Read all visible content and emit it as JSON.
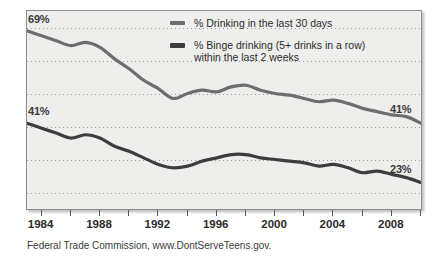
{
  "chart_data": {
    "type": "line",
    "title": "",
    "subtitle": "",
    "xlabel": "",
    "ylabel": "",
    "xlim": [
      1983,
      2010
    ],
    "ylim": [
      15,
      75
    ],
    "grid": true,
    "gridlines_y": [
      70,
      60,
      50,
      40,
      30,
      20
    ],
    "legend_position": "top-right",
    "x": [
      1983,
      1984,
      1985,
      1986,
      1987,
      1988,
      1989,
      1990,
      1991,
      1992,
      1993,
      1994,
      1995,
      1996,
      1997,
      1998,
      1999,
      2000,
      2001,
      2002,
      2003,
      2004,
      2005,
      2006,
      2007,
      2008,
      2009,
      2010
    ],
    "xticks": [
      1984,
      1986,
      1988,
      1990,
      1992,
      1994,
      1996,
      1998,
      2000,
      2002,
      2004,
      2006,
      2008,
      2010
    ],
    "xtick_labels": [
      "1984",
      "1988",
      "1992",
      "1996",
      "2000",
      "2004",
      "2008"
    ],
    "xtick_label_values": [
      1984,
      1988,
      1992,
      1996,
      2000,
      2004,
      2008
    ],
    "series": [
      {
        "name": "% Drinking in the last 30 days",
        "color": "#6d6d6d",
        "start_label": "69%",
        "end_label": "41%",
        "values": [
          69.0,
          67.5,
          66.0,
          64.5,
          65.5,
          64.0,
          60.5,
          57.5,
          54.0,
          51.5,
          48.5,
          50.0,
          51.0,
          50.5,
          52.0,
          52.5,
          51.0,
          50.0,
          49.5,
          48.5,
          47.5,
          48.0,
          47.0,
          45.5,
          44.5,
          43.5,
          43.0,
          41.0
        ]
      },
      {
        "name": "% Binge drinking (5+ drinks in a row) within the last 2 weeks",
        "color": "#3d3d3d",
        "start_label": "41%",
        "end_label": "23%",
        "values": [
          41.0,
          39.5,
          38.0,
          36.5,
          37.5,
          36.5,
          34.0,
          32.5,
          30.5,
          28.5,
          27.5,
          28.0,
          29.5,
          30.5,
          31.5,
          31.5,
          30.5,
          30.0,
          29.5,
          29.0,
          28.0,
          28.5,
          27.5,
          26.0,
          26.5,
          25.5,
          24.5,
          23.0
        ]
      }
    ],
    "annotations": [
      {
        "text": "69%",
        "series": 0,
        "position": "start"
      },
      {
        "text": "41%",
        "series": 0,
        "position": "end"
      },
      {
        "text": "41%",
        "series": 1,
        "position": "start"
      },
      {
        "text": "23%",
        "series": 1,
        "position": "end"
      }
    ]
  },
  "legend": {
    "items": [
      {
        "label": "% Drinking in the last 30 days",
        "color": "#6d6d6d"
      },
      {
        "label": "% Binge drinking (5+ drinks in a row)",
        "label_line2": "within the last 2 weeks",
        "color": "#3d3d3d"
      }
    ]
  },
  "caption": {
    "text": "Federal Trade Commission, www.DontServeTeens.gov."
  },
  "colors": {
    "plot_background": "#eeeeec",
    "frame": "#8e8e8e",
    "gridline": "#9a9a96",
    "text": "#2b2b2b",
    "series_light": "#6d6d6d",
    "series_dark": "#3d3d3d"
  }
}
